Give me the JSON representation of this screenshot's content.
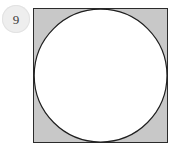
{
  "figure": {
    "background_color": "#ffffff",
    "badge": {
      "icon": "number-badge-circle",
      "number": "9",
      "fill_color": "#eeeeee",
      "text_color": "#3b3b3b",
      "diameter_px": 28
    },
    "diagram": {
      "description": "Shaded square with an inscribed white circle",
      "square": {
        "shape": "square",
        "fill_color": "#c8c8c8",
        "stroke_color": "#2b2b2b",
        "stroke_width_px": 1.6,
        "side_px": 134,
        "x_px": 34,
        "y_px": 9
      },
      "circle": {
        "shape": "circle",
        "fill_color": "#ffffff",
        "stroke_color": "#1f1f1f",
        "stroke_width_px": 1.2,
        "diameter_px": 134,
        "center_x_px": 101,
        "center_y_px": 76,
        "radius_px": 67,
        "relation": "inscribed, tangent to all four sides of the square"
      }
    }
  }
}
